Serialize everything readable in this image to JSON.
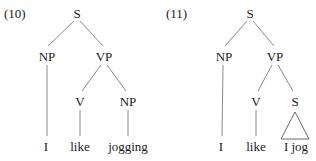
{
  "trees": [
    {
      "number": "(10)",
      "nodes": {
        "root": "S",
        "subject": "NP",
        "predicate": "VP",
        "verb": "V",
        "object": "NP"
      },
      "leaves": {
        "subject": "I",
        "verb": "like",
        "object": "jogging"
      }
    },
    {
      "number": "(11)",
      "nodes": {
        "root": "S",
        "subject": "NP",
        "predicate": "VP",
        "verb": "V",
        "complement": "S"
      },
      "leaves": {
        "subject": "I",
        "verb": "like",
        "complement": "I jog"
      },
      "complement_triangle": true
    }
  ]
}
